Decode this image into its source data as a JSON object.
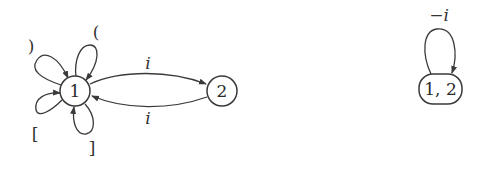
{
  "diagram": {
    "left_automaton": {
      "nodes": [
        {
          "id": "1",
          "label": "1"
        },
        {
          "id": "2",
          "label": "2"
        }
      ],
      "self_loops_on_node_1": [
        {
          "label": ")"
        },
        {
          "label": "("
        },
        {
          "label": "["
        },
        {
          "label": "]"
        }
      ],
      "edges": [
        {
          "from": "1",
          "to": "2",
          "label": "i"
        },
        {
          "from": "2",
          "to": "1",
          "label": "i"
        }
      ]
    },
    "right_automaton": {
      "nodes": [
        {
          "id": "1,2",
          "label": "1, 2"
        }
      ],
      "self_loops": [
        {
          "label": "−i"
        }
      ]
    },
    "colors": {
      "stroke": "#3a3a3a",
      "text": "#333333",
      "background": "#ffffff"
    }
  }
}
